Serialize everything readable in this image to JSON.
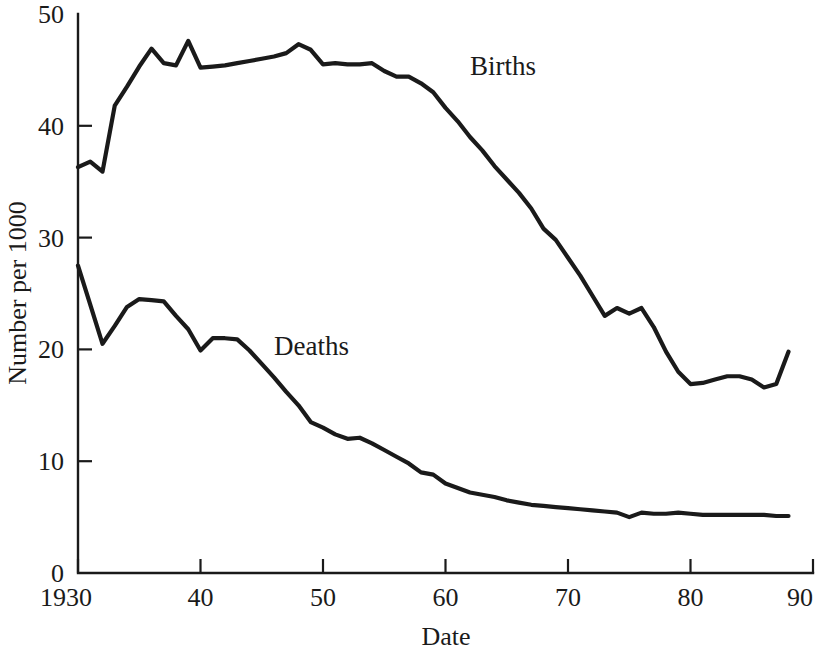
{
  "chart_data": {
    "type": "line",
    "title": "",
    "subtitle": "",
    "xlabel": "Date",
    "ylabel": "Number per 1000",
    "xlim": [
      1930,
      1990
    ],
    "ylim": [
      0,
      50
    ],
    "grid": false,
    "legend_position": "inline-annotation",
    "x_tick_labels": [
      "1930",
      "40",
      "50",
      "60",
      "70",
      "80",
      "90"
    ],
    "x_tick_values": [
      1930,
      1940,
      1950,
      1960,
      1970,
      1980,
      1990
    ],
    "y_tick_labels": [
      "0",
      "10",
      "20",
      "30",
      "40",
      "50"
    ],
    "y_tick_values": [
      0,
      10,
      20,
      30,
      40,
      50
    ],
    "annotations": [
      {
        "text": "Births",
        "x": 1962,
        "y": 44.5
      },
      {
        "text": "Deaths",
        "x": 1946,
        "y": 19.5
      }
    ],
    "x": [
      1930,
      1931,
      1932,
      1933,
      1934,
      1935,
      1936,
      1937,
      1938,
      1939,
      1940,
      1941,
      1942,
      1943,
      1944,
      1945,
      1946,
      1947,
      1948,
      1949,
      1950,
      1951,
      1952,
      1953,
      1954,
      1955,
      1956,
      1957,
      1958,
      1959,
      1960,
      1961,
      1962,
      1963,
      1964,
      1965,
      1966,
      1967,
      1968,
      1969,
      1970,
      1971,
      1972,
      1973,
      1974,
      1975,
      1976,
      1977,
      1978,
      1979,
      1980,
      1981,
      1982,
      1983,
      1984,
      1985,
      1986,
      1987,
      1988
    ],
    "series": [
      {
        "name": "Births",
        "values": [
          36.3,
          36.8,
          35.9,
          41.8,
          43.5,
          45.3,
          46.9,
          45.6,
          45.4,
          47.6,
          45.2,
          45.3,
          45.4,
          45.6,
          45.8,
          46.0,
          46.2,
          46.5,
          47.3,
          46.8,
          45.5,
          45.6,
          45.5,
          45.5,
          45.6,
          44.9,
          44.4,
          44.4,
          43.8,
          43.0,
          41.6,
          40.4,
          39.0,
          37.8,
          36.4,
          35.2,
          34.0,
          32.6,
          30.8,
          29.8,
          28.2,
          26.6,
          24.8,
          23.0,
          23.7,
          23.2,
          23.7,
          22.0,
          19.8,
          18.0,
          16.9,
          17.0,
          17.3,
          17.6,
          17.6,
          17.3,
          16.6,
          16.9,
          19.8
        ]
      },
      {
        "name": "Deaths",
        "values": [
          27.5,
          24.0,
          20.5,
          22.1,
          23.8,
          24.5,
          24.4,
          24.3,
          23.0,
          21.8,
          19.9,
          21.0,
          21.0,
          20.9,
          19.9,
          18.7,
          17.5,
          16.2,
          15.0,
          13.5,
          13.0,
          12.4,
          12.0,
          12.1,
          11.6,
          11.0,
          10.4,
          9.8,
          9.0,
          8.8,
          8.0,
          7.6,
          7.2,
          7.0,
          6.8,
          6.5,
          6.3,
          6.1,
          6.0,
          5.9,
          5.8,
          5.7,
          5.6,
          5.5,
          5.4,
          5.0,
          5.4,
          5.3,
          5.3,
          5.4,
          5.3,
          5.2,
          5.2,
          5.2,
          5.2,
          5.2,
          5.2,
          5.1,
          5.1
        ]
      }
    ]
  },
  "axes": {
    "y_title": "Number per 1000",
    "x_title": "Date"
  }
}
